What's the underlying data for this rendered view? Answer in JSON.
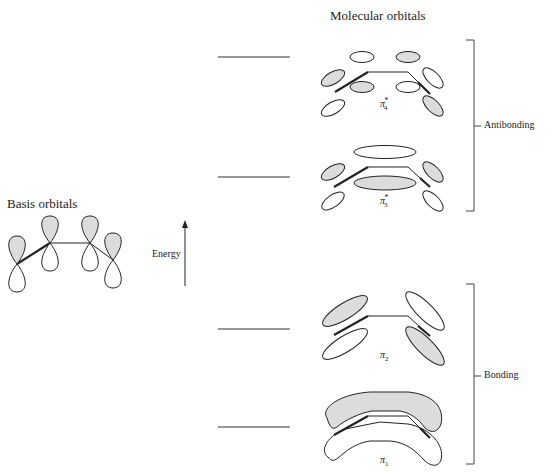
{
  "titles": {
    "basis": "Basis orbitals",
    "molecular": "Molecular orbitals"
  },
  "energy_axis": {
    "label": "Energy",
    "direction": "up"
  },
  "groups": {
    "antibonding": "Antibonding",
    "bonding": "Bonding"
  },
  "levels": [
    {
      "name": "pi4_star",
      "symbol": "π",
      "sub": "4",
      "sup": "*",
      "group": "antibonding",
      "line_y": 57
    },
    {
      "name": "pi3_star",
      "symbol": "π",
      "sub": "3",
      "sup": "*",
      "group": "antibonding",
      "line_y": 177
    },
    {
      "name": "pi2",
      "symbol": "π",
      "sub": "2",
      "sup": "",
      "group": "bonding",
      "line_y": 329
    },
    {
      "name": "pi1",
      "symbol": "π",
      "sub": "1",
      "sup": "",
      "group": "bonding",
      "line_y": 427
    }
  ],
  "colors": {
    "line": "#222222",
    "shade": "#dcdcdc",
    "background": "#ffffff"
  }
}
